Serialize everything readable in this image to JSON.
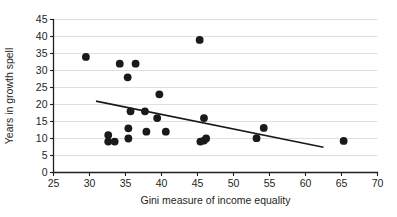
{
  "chart_data": {
    "type": "scatter",
    "title": "",
    "xlabel": "Gini measure of income equality",
    "ylabel": "Years in growth spell",
    "xlim": [
      25,
      70
    ],
    "ylim": [
      0,
      45
    ],
    "xticks": [
      25,
      30,
      35,
      40,
      45,
      50,
      55,
      60,
      65,
      70
    ],
    "yticks": [
      0,
      5,
      10,
      15,
      20,
      25,
      30,
      35,
      40,
      45
    ],
    "grid": "horizontal",
    "legend": "none",
    "marker": {
      "shape": "circle",
      "color": "#1a1a1a",
      "size": 4.6
    },
    "points": [
      {
        "x": 29.5,
        "y": 34.0
      },
      {
        "x": 32.6,
        "y": 11.0
      },
      {
        "x": 32.6,
        "y": 9.1
      },
      {
        "x": 33.5,
        "y": 9.1
      },
      {
        "x": 34.2,
        "y": 32.0
      },
      {
        "x": 35.3,
        "y": 28.0
      },
      {
        "x": 35.4,
        "y": 13.0
      },
      {
        "x": 35.4,
        "y": 10.0
      },
      {
        "x": 35.7,
        "y": 18.0
      },
      {
        "x": 36.4,
        "y": 32.0
      },
      {
        "x": 37.7,
        "y": 18.0
      },
      {
        "x": 37.9,
        "y": 12.0
      },
      {
        "x": 39.4,
        "y": 16.0
      },
      {
        "x": 39.7,
        "y": 23.0
      },
      {
        "x": 40.6,
        "y": 12.0
      },
      {
        "x": 45.3,
        "y": 39.0
      },
      {
        "x": 45.4,
        "y": 9.1
      },
      {
        "x": 45.9,
        "y": 16.0
      },
      {
        "x": 45.9,
        "y": 9.4
      },
      {
        "x": 46.2,
        "y": 10.0
      },
      {
        "x": 53.2,
        "y": 10.1
      },
      {
        "x": 54.2,
        "y": 13.1
      },
      {
        "x": 65.3,
        "y": 9.3
      }
    ],
    "trendline": {
      "type": "linear",
      "x_start": 30.9,
      "y_start": 21.0,
      "x_end": 62.5,
      "y_end": 7.4,
      "color": "#1a1a1a",
      "width": 1.6
    },
    "axis_color": "#231f20",
    "grid_color": "#dcdcdc"
  }
}
